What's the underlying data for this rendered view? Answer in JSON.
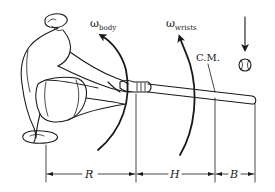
{
  "diagram": {
    "type": "physics-schematic",
    "labels": {
      "omega_body": {
        "symbol": "ω",
        "subscript": "body"
      },
      "omega_wrists": {
        "symbol": "ω",
        "subscript": "wrists"
      },
      "center_of_mass": "C.M.",
      "dim_R": "R",
      "dim_H": "H",
      "dim_B": "B"
    },
    "elements": [
      {
        "id": "batter",
        "description": "batter seen from above, holding bat"
      },
      {
        "id": "bat",
        "description": "bat extending right from hands"
      },
      {
        "id": "ball",
        "description": "baseball with downward arrow above it"
      },
      {
        "id": "arc-body",
        "description": "curved rotation arrow for body, labeled ω_body"
      },
      {
        "id": "arc-wrists",
        "description": "curved rotation arrow for wrists, labeled ω_wrists"
      },
      {
        "id": "cm-pointer",
        "description": "leader line from C.M. label to bat"
      },
      {
        "id": "dimension-R",
        "description": "distance from body pivot to hands"
      },
      {
        "id": "dimension-H",
        "description": "distance from hands to center of mass"
      },
      {
        "id": "dimension-B",
        "description": "distance from center of mass to bat end"
      }
    ],
    "colors": {
      "ink": "#1a1a1a",
      "background": "#ffffff"
    }
  }
}
